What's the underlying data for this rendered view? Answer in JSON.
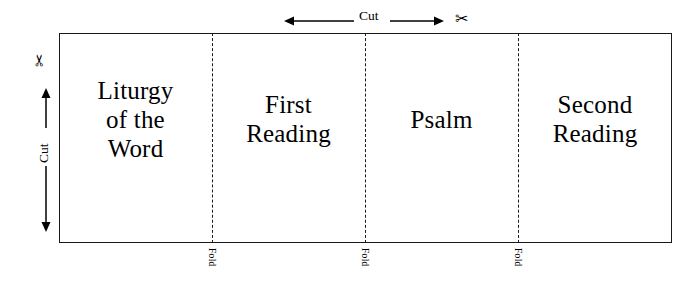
{
  "diagram": {
    "sheet": {
      "border_color": "#1a1a1a",
      "background": "#ffffff"
    },
    "panels": [
      {
        "id": "panel-liturgy-of-the-word",
        "label": "Liturgy\nof the\nWord"
      },
      {
        "id": "panel-first-reading",
        "label": "First\nReading"
      },
      {
        "id": "panel-psalm",
        "label": "Psalm"
      },
      {
        "id": "panel-second-reading",
        "label": "Second\nReading"
      }
    ],
    "fold_lines": [
      {
        "id": "fold-1",
        "label": "Fold"
      },
      {
        "id": "fold-2",
        "label": "Fold"
      },
      {
        "id": "fold-3",
        "label": "Fold"
      }
    ],
    "cut_markers": {
      "top": {
        "label": "Cut",
        "icon": "scissors-icon",
        "glyph": "✂",
        "direction": "horizontal-double-arrow"
      },
      "left": {
        "label": "Cut",
        "icon": "scissors-icon",
        "glyph": "✂",
        "direction": "vertical-double-arrow"
      }
    }
  }
}
